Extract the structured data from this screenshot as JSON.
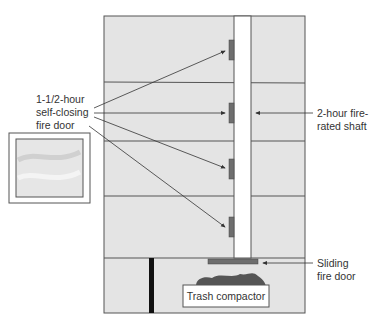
{
  "diagram": {
    "labels": {
      "fire_door": [
        "1-1/2-hour",
        "self-closing",
        "fire door"
      ],
      "shaft": [
        "2-hour fire-",
        "rated shaft"
      ],
      "sliding_door": [
        "Sliding",
        "fire door"
      ],
      "compactor": "Trash compactor"
    },
    "floors": 4,
    "colors": {
      "floor_fill": "#e4e4e4",
      "door_fill": "#6e6e6e",
      "trash_fill": "#555555",
      "line": "#444444"
    }
  }
}
